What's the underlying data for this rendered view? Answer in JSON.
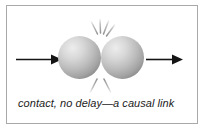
{
  "figure": {
    "caption": "contact, no delay—a causal link",
    "border_color": "#a9a9a9",
    "background_color": "#ffffff",
    "text_color": "#1c1c1c"
  },
  "diagram": {
    "type": "physics-collision-illustration",
    "stroke_color": "#1a1a1a",
    "sphere_color_light": "#e8e8e8",
    "sphere_color_mid": "#b8b8b8",
    "sphere_color_dark": "#8f8f8f",
    "impact_line_color": "#9a9a9a",
    "elements": {
      "left_arrow_label": "incoming motion arrow",
      "right_arrow_label": "outgoing motion arrow",
      "left_sphere_label": "left sphere",
      "right_sphere_label": "right sphere",
      "impact_lines_top_label": "impact lines above contact point",
      "impact_lines_bottom_label": "impact lines below contact point"
    }
  }
}
